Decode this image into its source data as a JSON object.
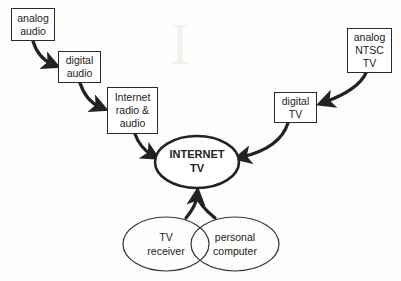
{
  "diagram": {
    "nodes": {
      "analog_audio": {
        "label": "analog\naudio"
      },
      "digital_audio": {
        "label": "digital\naudio"
      },
      "internet_radio": {
        "label": "Internet\nradio &\naudio"
      },
      "analog_ntsc_tv": {
        "label": "analog\nNTSC\nTV"
      },
      "digital_tv": {
        "label": "digital\nTV"
      },
      "internet_tv": {
        "label": "INTERNET\nTV"
      },
      "tv_receiver": {
        "label": "TV\nreceiver"
      },
      "personal_computer": {
        "label": "personal\ncomputer"
      }
    },
    "edges": [
      {
        "from": "analog_audio",
        "to": "digital_audio"
      },
      {
        "from": "digital_audio",
        "to": "internet_radio"
      },
      {
        "from": "internet_radio",
        "to": "internet_tv"
      },
      {
        "from": "analog_ntsc_tv",
        "to": "digital_tv"
      },
      {
        "from": "digital_tv",
        "to": "internet_tv"
      },
      {
        "from": "tv_receiver",
        "to": "internet_tv"
      },
      {
        "from": "personal_computer",
        "to": "internet_tv"
      }
    ],
    "colors": {
      "stroke": "#222222",
      "background": "#fdfdfb",
      "box_fill": "#ffffff"
    }
  }
}
